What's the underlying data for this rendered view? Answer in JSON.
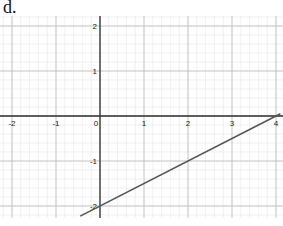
{
  "label": "d.",
  "chart_data": {
    "type": "line",
    "title": "",
    "xlabel": "",
    "ylabel": "",
    "xlim": [
      -2.25,
      4.1
    ],
    "ylim": [
      -2.2,
      2.2
    ],
    "grid": true,
    "minor_grid_step": 0.2,
    "x_ticks": [
      -2,
      -1,
      0,
      1,
      2,
      3,
      4
    ],
    "y_ticks": [
      2,
      1,
      -1,
      -2
    ],
    "series": [
      {
        "name": "line",
        "equation": "y = 0.5x - 2",
        "x": [
          -0.45,
          4.1
        ],
        "y": [
          -2.225,
          0.05
        ],
        "color": "#555555"
      }
    ]
  }
}
